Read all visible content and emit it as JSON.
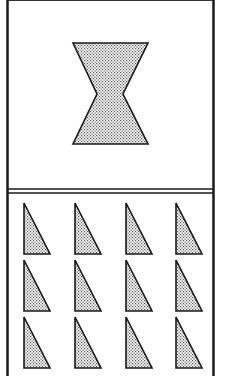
{
  "figure": {
    "colors": {
      "background": "#ffffff",
      "stroke": "#1a1a1a",
      "fill_dots": "#555555"
    },
    "top_panel": {
      "shape": "hourglass",
      "count": 1
    },
    "bottom_panel": {
      "shape": "right-triangle",
      "rows": 3,
      "columns": 4,
      "count": 12
    }
  }
}
